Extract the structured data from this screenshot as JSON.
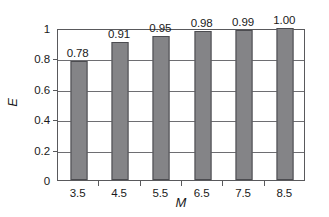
{
  "chart_data": {
    "type": "bar",
    "title": "",
    "xlabel": "M",
    "ylabel": "E",
    "categories": [
      "3.5",
      "4.5",
      "5.5",
      "6.5",
      "7.5",
      "8.5"
    ],
    "values": [
      0.78,
      0.91,
      0.95,
      0.98,
      0.99,
      1.0
    ],
    "data_labels": [
      "0.78",
      "0.91",
      "0.95",
      "0.98",
      "0.99",
      "1.00"
    ],
    "ylim": [
      0,
      1
    ],
    "y_ticks": [
      0,
      0.2,
      0.4,
      0.6,
      0.8,
      1
    ],
    "y_tick_labels": [
      "0",
      "0.2",
      "0.4",
      "0.6",
      "0.8",
      "1"
    ],
    "grid": "horizontal",
    "legend": "none",
    "bar_color": "#848487",
    "bar_edge_color": "#4c4c50",
    "axis_color": "#59595c",
    "grid_color": "#6e6e72",
    "background_color": "#ffffff"
  }
}
